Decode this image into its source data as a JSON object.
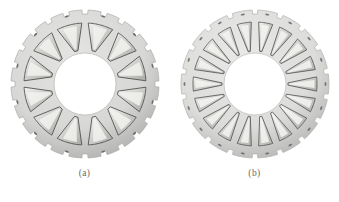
{
  "page": {
    "background_color": "#ffffff",
    "width": 339,
    "height": 202
  },
  "figures": [
    {
      "id": "stator-a",
      "caption": "(a)",
      "label_text": "(a)",
      "description": "Stator lamination cross-section with wide trapezoidal slots",
      "slot_count": 12,
      "outer_notch_count": 24,
      "rivet_hole_count": 12,
      "geometry": {
        "center_x": 80,
        "center_y": 84,
        "outer_radius": 74,
        "yoke_inner_radius": 66,
        "slot_outer_radius": 61,
        "slot_inner_radius": 34,
        "bore_radius": 31,
        "slot_half_angle_deg": 12.0,
        "tooth_tip_half_angle_deg": 3.0,
        "notch_half_angle_deg": 2.4,
        "notch_depth": 4
      },
      "colors": {
        "body_fill": "#d7d7d5",
        "body_fill_light": "#e4e4e2",
        "body_edge": "#a9a9a7",
        "slot_fill": "#c9c9c6",
        "slot_edge": "#4a4a4a",
        "slot_highlight": "#f2f2f0",
        "bore_fill": "#ffffff",
        "hole_fill": "#595959"
      }
    },
    {
      "id": "stator-b",
      "caption": "(b)",
      "label_text": "(b)",
      "description": "Stator lamination cross-section with narrow tapered slots",
      "slot_count": 18,
      "outer_notch_count": 18,
      "rivet_hole_count": 18,
      "geometry": {
        "center_x": 80,
        "center_y": 84,
        "outer_radius": 74,
        "yoke_inner_radius": 66,
        "slot_outer_radius": 62,
        "slot_inner_radius": 33,
        "bore_radius": 31,
        "slot_half_angle_deg": 6.6,
        "tooth_tip_half_angle_deg": 1.9,
        "notch_half_angle_deg": 2.2,
        "notch_depth": 4
      },
      "colors": {
        "body_fill": "#dcdcda",
        "body_fill_light": "#e9e9e7",
        "body_edge": "#b0b0ae",
        "slot_fill": "#c4c4c1",
        "slot_edge": "#565656",
        "slot_highlight": "#f4f4f2",
        "bore_fill": "#ffffff",
        "hole_fill": "#5e5e5e"
      }
    }
  ]
}
